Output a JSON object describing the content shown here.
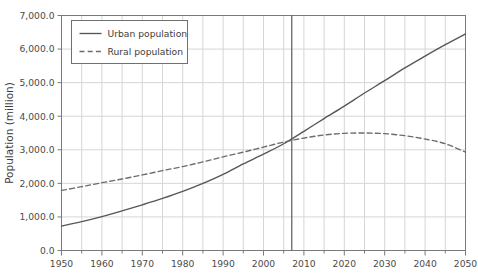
{
  "chart_data": {
    "type": "line",
    "title": "",
    "xlabel": "",
    "ylabel": "Population (million)",
    "xlim": [
      1950,
      2050
    ],
    "ylim": [
      0,
      7000
    ],
    "grid": true,
    "legend_position": "top-left",
    "x_ticks": [
      1950,
      1960,
      1970,
      1980,
      1990,
      2000,
      2010,
      2020,
      2030,
      2040,
      2050
    ],
    "x_tick_labels": [
      "1950",
      "1960",
      "1970",
      "1980",
      "1990",
      "2000",
      "2010",
      "2020",
      "2030",
      "2040",
      "2050"
    ],
    "x_minor_ticks": [
      1955,
      1965,
      1975,
      1985,
      1995,
      2005,
      2015,
      2025,
      2035,
      2045
    ],
    "y_ticks": [
      0,
      1000,
      2000,
      3000,
      4000,
      5000,
      6000,
      7000
    ],
    "y_tick_labels": [
      "0.0",
      "1,000.0",
      "2,000.0",
      "3,000.0",
      "4,000.0",
      "5,000.0",
      "6,000.0",
      "7,000.0"
    ],
    "x": [
      1950,
      1955,
      1960,
      1965,
      1970,
      1975,
      1980,
      1985,
      1990,
      1995,
      2000,
      2005,
      2010,
      2015,
      2020,
      2025,
      2030,
      2035,
      2040,
      2045,
      2050
    ],
    "series": [
      {
        "name": "Urban population",
        "style": "solid",
        "color": "#55565a",
        "values": [
          730,
          860,
          1010,
          1180,
          1360,
          1550,
          1760,
          2000,
          2270,
          2580,
          2870,
          3180,
          3550,
          3930,
          4300,
          4690,
          5060,
          5440,
          5790,
          6130,
          6450
        ]
      },
      {
        "name": "Rural population",
        "style": "dashed",
        "color": "#6b6c70",
        "values": [
          1790,
          1900,
          2020,
          2130,
          2250,
          2380,
          2500,
          2640,
          2790,
          2930,
          3080,
          3230,
          3350,
          3440,
          3490,
          3500,
          3480,
          3420,
          3320,
          3180,
          2930
        ]
      }
    ],
    "annotations": [
      {
        "type": "vertical-line",
        "name": "crossover-marker",
        "x": 2007,
        "label": ""
      }
    ],
    "legend": [
      {
        "label": "Urban population",
        "style": "solid"
      },
      {
        "label": "Rural population",
        "style": "dashed"
      }
    ],
    "colors": {
      "urban": "#55565a",
      "rural": "#6b6c70",
      "grid": "#d6d6d6",
      "axis": "#7a7a7a",
      "marker": "#5a5a5a",
      "text": "#3d3d3d",
      "background": "#ffffff"
    }
  }
}
